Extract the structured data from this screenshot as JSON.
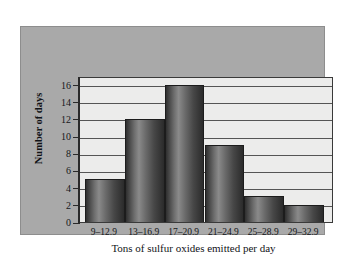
{
  "chart_data": {
    "type": "bar",
    "title": "",
    "subtitle": "",
    "categories": [
      "9–12.9",
      "13–16.9",
      "17–20.9",
      "21–24.9",
      "25–28.9",
      "29–32.9"
    ],
    "values": [
      5,
      12,
      16,
      9,
      3,
      2
    ],
    "xlabel": "Tons of sulfur oxides emitted per day",
    "ylabel": "Number of days",
    "ylim": [
      0,
      17
    ],
    "ytick_labels": [
      "0",
      "2",
      "4",
      "6",
      "8",
      "10",
      "12",
      "14",
      "16"
    ],
    "ytick_values": [
      0,
      2,
      4,
      6,
      8,
      10,
      12,
      14,
      16
    ],
    "grid": true,
    "legend": "none",
    "orientation": "vertical",
    "bar_style": "adjacent-histogram-cylinder-gradient"
  },
  "colors": {
    "panel_background": "#a9a9a9",
    "plot_background": "#ececeb",
    "bar_dark": "#2b2b2b",
    "bar_light": "#8a8a8a",
    "axis": "#2a2a2a",
    "gridline": "#555555",
    "text": "#15171a",
    "figure_background": "#ffffff"
  }
}
